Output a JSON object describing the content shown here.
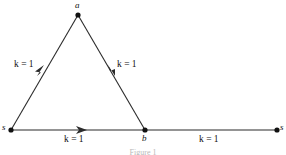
{
  "figure": {
    "type": "directed-graph-diagram",
    "caption": "Figure 1",
    "stroke_color": "#2b2b2b",
    "text_color": "#111111",
    "background_color": "#ffffff"
  },
  "nodes": [
    {
      "id": "s-left",
      "label": "s",
      "x": 11,
      "y": 130,
      "label_x": 2,
      "label_y": 125
    },
    {
      "id": "a",
      "label": "a",
      "x": 78,
      "y": 15,
      "label_x": 75,
      "label_y": 2
    },
    {
      "id": "b",
      "label": "b",
      "x": 145,
      "y": 130,
      "label_x": 142,
      "label_y": 134
    },
    {
      "id": "s-right",
      "label": "s",
      "x": 277,
      "y": 130,
      "label_x": 280,
      "label_y": 125
    }
  ],
  "edges": [
    {
      "id": "s-to-a",
      "from": "s-left",
      "to": "a",
      "weight_label": "k = 1",
      "weight_symbol": "k",
      "weight_value": "1",
      "label_x": 14,
      "label_y": 62,
      "arrow_x": 43,
      "arrow_y": 69
    },
    {
      "id": "a-to-b",
      "from": "a",
      "to": "b",
      "weight_label": "k = 1",
      "weight_symbol": "k",
      "weight_value": "1",
      "label_x": 117,
      "label_y": 62,
      "arrow_x": 113,
      "arrow_y": 69
    },
    {
      "id": "s-to-b",
      "from": "s-left",
      "to": "b",
      "weight_label": "k = 1",
      "weight_symbol": "k",
      "weight_value": "1",
      "label_x": 64,
      "label_y": 136,
      "arrow_x": 80,
      "arrow_y": 130
    },
    {
      "id": "b-to-s",
      "from": "b",
      "to": "s-right",
      "weight_label": "k = 1",
      "weight_symbol": "k",
      "weight_value": "1",
      "label_x": 199,
      "label_y": 136,
      "arrow_x": null,
      "arrow_y": null
    }
  ]
}
